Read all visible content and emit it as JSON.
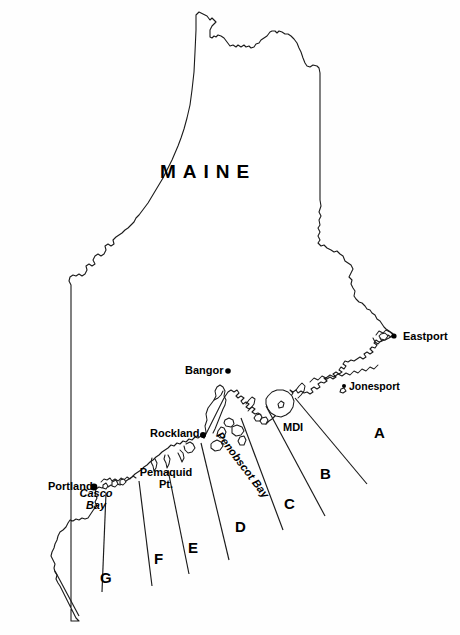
{
  "map": {
    "title": "MAINE",
    "background_color": "#ffffff",
    "line_color": "#1a1a1a",
    "width": 460,
    "height": 635,
    "state_name_label": "MAINE",
    "cities": [
      {
        "name": "Eastport",
        "label": "Eastport",
        "label_x": 403,
        "label_y": 331,
        "dot_x": 394,
        "dot_y": 336,
        "dot_r": 2.6,
        "anchor": "left"
      },
      {
        "name": "Jonesport",
        "label": "Jonesport",
        "label_x": 349,
        "label_y": 382,
        "dot_x": 344,
        "dot_y": 386,
        "dot_r": 2.0,
        "anchor": "left"
      },
      {
        "name": "Bangor",
        "label": "Bangor",
        "label_x": 185,
        "label_y": 366,
        "dot_x": 228,
        "dot_y": 371,
        "dot_r": 2.8,
        "anchor": "left"
      },
      {
        "name": "Rockland",
        "label": "Rockland",
        "label_x": 150,
        "label_y": 428,
        "dot_x": 203,
        "dot_y": 435,
        "dot_r": 3.0,
        "anchor": "left"
      },
      {
        "name": "Portland",
        "label": "Portland",
        "label_x": 48,
        "label_y": 481,
        "dot_x": 94,
        "dot_y": 487,
        "dot_r": 3.4,
        "anchor": "left"
      }
    ],
    "places": [
      {
        "name": "Pemaquid Pt.",
        "line1": "Pemaquid",
        "line2": "Pt.",
        "x": 166,
        "y": 470
      },
      {
        "name": "MDI",
        "label": "MDI",
        "x": 283,
        "y": 424
      }
    ],
    "water_features": [
      {
        "name": "Casco Bay",
        "line1": "Casco",
        "line2": "Bay",
        "x": 96,
        "y": 489,
        "style": "italic"
      },
      {
        "name": "Penobscot Bay",
        "label": "Penobscot Bay",
        "x": 223,
        "y": 430,
        "rotation_deg": 53,
        "style": "italic"
      }
    ],
    "zones": [
      {
        "letter": "A",
        "x": 374,
        "y": 425
      },
      {
        "letter": "B",
        "x": 320,
        "y": 466
      },
      {
        "letter": "C",
        "x": 284,
        "y": 496
      },
      {
        "letter": "D",
        "x": 235,
        "y": 519
      },
      {
        "letter": "E",
        "x": 188,
        "y": 540
      },
      {
        "letter": "F",
        "x": 154,
        "y": 551
      },
      {
        "letter": "G",
        "x": 100,
        "y": 570
      }
    ],
    "zone_dividers": [
      {
        "id": "A-B",
        "x1": 295,
        "y1": 398,
        "x2": 367,
        "y2": 484
      },
      {
        "id": "B-C",
        "x1": 266,
        "y1": 406,
        "x2": 325,
        "y2": 516
      },
      {
        "id": "C-D",
        "x1": 241,
        "y1": 418,
        "x2": 283,
        "y2": 530
      },
      {
        "id": "D-E",
        "x1": 201,
        "y1": 443,
        "x2": 229,
        "y2": 560
      },
      {
        "id": "E-F",
        "x1": 168,
        "y1": 470,
        "x2": 189,
        "y2": 574
      },
      {
        "id": "F-G",
        "x1": 139,
        "y1": 481,
        "x2": 152,
        "y2": 586
      },
      {
        "id": "G-edge",
        "x1": 106,
        "y1": 493,
        "x2": 102,
        "y2": 592
      },
      {
        "id": "G-southwest",
        "x1": 55,
        "y1": 571,
        "x2": 79,
        "y2": 616
      }
    ],
    "legend_note": ""
  }
}
